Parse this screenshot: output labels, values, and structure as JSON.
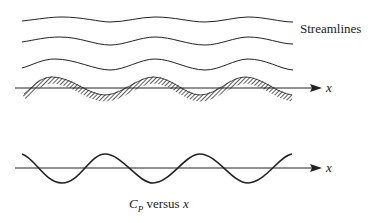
{
  "labels": {
    "streamlines": "Streamlines",
    "x_axis_top": "x",
    "x_axis_bottom": "x",
    "cp_letter": "C",
    "cp_sub": "P",
    "cp_rest": " versus ",
    "cp_x": "x"
  },
  "colors": {
    "ink": "#222222",
    "hatch": "#555555"
  }
}
